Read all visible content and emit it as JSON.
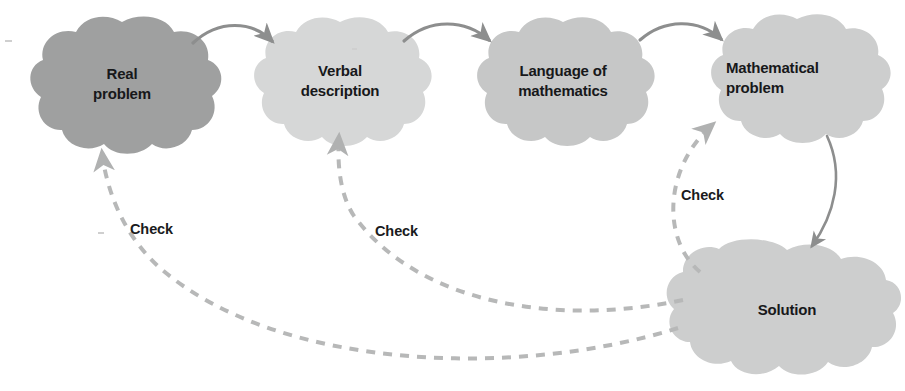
{
  "diagram": {
    "background_color": "#ffffff",
    "nodes": [
      {
        "id": "real-problem",
        "label": "Real\nproblem",
        "shape": "cloud",
        "fill": "#9fa0a0",
        "center_x": 122,
        "center_y": 88,
        "width": 180,
        "height": 132,
        "text_align": "center"
      },
      {
        "id": "verbal-description",
        "label": "Verbal\ndescription",
        "shape": "cloud",
        "fill": "#d6d7d7",
        "center_x": 340,
        "center_y": 85,
        "width": 168,
        "height": 126,
        "text_align": "center"
      },
      {
        "id": "language-of-mathematics",
        "label": "Language of\nmathematics",
        "shape": "cloud",
        "fill": "#c6c7c7",
        "center_x": 563,
        "center_y": 85,
        "width": 168,
        "height": 126,
        "text_align": "center"
      },
      {
        "id": "mathematical-problem",
        "label": "Mathematical\nproblem",
        "shape": "cloud",
        "fill": "#cdcece",
        "center_x": 797,
        "center_y": 82,
        "width": 172,
        "height": 126,
        "text_align": "left"
      },
      {
        "id": "solution",
        "label": "Solution",
        "shape": "cloud",
        "fill": "#cdcece",
        "center_x": 787,
        "center_y": 314,
        "width": 232,
        "height": 140,
        "text_align": "center"
      }
    ],
    "edges": [
      {
        "id": "real-to-verbal",
        "from": "real-problem",
        "to": "verbal-description",
        "style": "solid",
        "color": "#8d8e8e",
        "label": ""
      },
      {
        "id": "verbal-to-language",
        "from": "verbal-description",
        "to": "language-of-mathematics",
        "style": "solid",
        "color": "#8d8e8e",
        "label": ""
      },
      {
        "id": "language-to-mathematical",
        "from": "language-of-mathematics",
        "to": "mathematical-problem",
        "style": "solid",
        "color": "#8d8e8e",
        "label": ""
      },
      {
        "id": "mathematical-to-solution",
        "from": "mathematical-problem",
        "to": "solution",
        "style": "solid",
        "color": "#8d8e8e",
        "label": ""
      },
      {
        "id": "solution-to-mathematical-check",
        "from": "solution",
        "to": "mathematical-problem",
        "style": "dashed",
        "color": "#b7b8b8",
        "label": "Check"
      },
      {
        "id": "solution-to-verbal-check",
        "from": "solution",
        "to": "verbal-description",
        "style": "dashed",
        "color": "#b7b8b8",
        "label": "Check"
      },
      {
        "id": "solution-to-real-check",
        "from": "solution",
        "to": "real-problem",
        "style": "dashed",
        "color": "#b7b8b8",
        "label": "Check"
      }
    ],
    "edge_labels": [
      {
        "id": "check-real",
        "text": "Check",
        "x": 130,
        "y": 221
      },
      {
        "id": "check-verbal",
        "text": "Check",
        "x": 375,
        "y": 223
      },
      {
        "id": "check-mathematical",
        "text": "Check",
        "x": 681,
        "y": 187
      }
    ]
  }
}
